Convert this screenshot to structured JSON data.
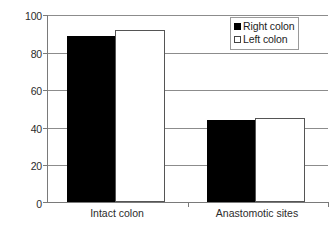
{
  "chart_data": {
    "type": "bar",
    "title": "",
    "xlabel": "",
    "ylabel": "",
    "ylim": [
      0,
      100
    ],
    "yticks": [
      0,
      20,
      40,
      60,
      80,
      100
    ],
    "ytick_labels": [
      "0",
      "20",
      "40",
      "60",
      "80",
      "100"
    ],
    "grid": true,
    "legend_position": "top-right",
    "categories": [
      "Intact colon",
      "Anastomotic sites"
    ],
    "series": [
      {
        "name": "Right colon",
        "swatch": "filled-black-square",
        "color": "#000000",
        "values": [
          89,
          44
        ]
      },
      {
        "name": "Left colon",
        "swatch": "hollow-white-square",
        "color": "#ffffff",
        "values": [
          92,
          45
        ]
      }
    ]
  },
  "legend": {
    "items": [
      {
        "label": "Right colon",
        "swatch": "filled"
      },
      {
        "label": "Left colon",
        "swatch": "hollow"
      }
    ]
  },
  "axis": {
    "y_labels": [
      "100",
      "80",
      "60",
      "40",
      "20",
      "0"
    ],
    "x_labels": [
      "Intact colon",
      "Anastomotic sites"
    ]
  }
}
